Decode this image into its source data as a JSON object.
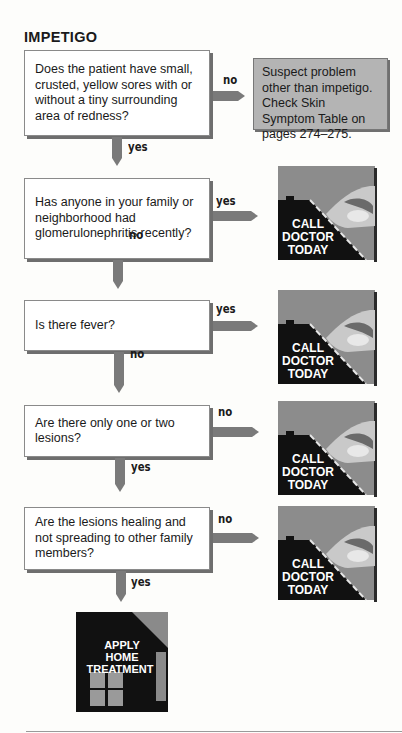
{
  "title": "IMPETIGO",
  "colors": {
    "arrow": "#7a7a7a",
    "box_border": "#8a8a8a",
    "note_bg": "#b4b4b4",
    "icon_bg": "#8c8c8c",
    "icon_dark": "#111111"
  },
  "questions": [
    {
      "text": "Does the patient have small, crusted, yellow sores with or without a tiny surrounding area of redness?",
      "side_label": "no",
      "down_label": "yes"
    },
    {
      "text": "Has anyone in your family or neighborhood had glomerulonephritis recently?",
      "side_label": "yes",
      "down_label": "no"
    },
    {
      "text": "Is there fever?",
      "side_label": "yes",
      "down_label": "no"
    },
    {
      "text": "Are there only one or two lesions?",
      "side_label": "no",
      "down_label": "yes"
    },
    {
      "text": "Are the lesions healing and not spreading to other family members?",
      "side_label": "no",
      "down_label": "yes"
    }
  ],
  "note": {
    "text": "Suspect problem other than impetigo. Check Skin Symptom Table on pages 274–275."
  },
  "call_doctor": {
    "line1": "CALL",
    "line2": "DOCTOR",
    "line3": "TODAY",
    "icon": "hand-phone-icon"
  },
  "home_treatment": {
    "line1": "APPLY",
    "line2": "HOME",
    "line3": "TREATMENT",
    "icon": "house-icon"
  }
}
